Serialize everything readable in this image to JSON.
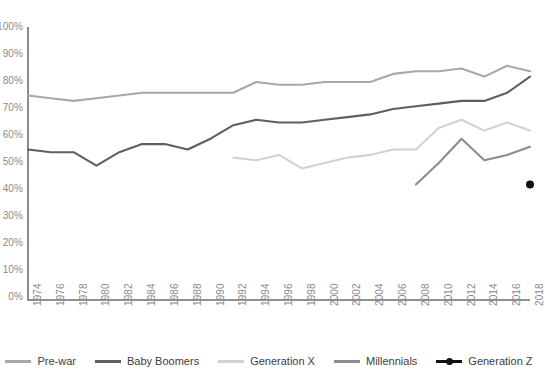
{
  "chart_data": {
    "type": "line",
    "title": "",
    "xlabel": "",
    "ylabel": "",
    "grid": false,
    "legend_position": "bottom",
    "xlim": [
      1974,
      2018
    ],
    "ylim": [
      0,
      100
    ],
    "y_ticks": [
      0,
      10,
      20,
      30,
      40,
      50,
      60,
      70,
      80,
      90,
      100
    ],
    "y_tick_labels": [
      "0%",
      "10%",
      "20%",
      "30%",
      "40%",
      "50%",
      "60%",
      "70%",
      "80%",
      "90%",
      "100%"
    ],
    "x_tick_labels": [
      "1974",
      "1976",
      "1978",
      "1980",
      "1982",
      "1984",
      "1986",
      "1988",
      "1990",
      "1992",
      "1994",
      "1996",
      "1998",
      "2000",
      "2002",
      "2004",
      "2006",
      "2008",
      "2010",
      "2012",
      "2014",
      "2016",
      "2018"
    ],
    "x": [
      1974,
      1976,
      1978,
      1980,
      1982,
      1984,
      1986,
      1988,
      1990,
      1992,
      1994,
      1996,
      1998,
      2000,
      2002,
      2004,
      2006,
      2008,
      2010,
      2012,
      2014,
      2016,
      2018
    ],
    "series": [
      {
        "name": "Pre-war",
        "color": "#a8a8a8",
        "marker": false,
        "x": [
          1974,
          1976,
          1978,
          1980,
          1982,
          1984,
          1986,
          1988,
          1990,
          1992,
          1994,
          1996,
          1998,
          2000,
          2002,
          2004,
          2006,
          2008,
          2010,
          2012,
          2014,
          2016,
          2018
        ],
        "values": [
          75,
          74,
          73,
          74,
          75,
          76,
          76,
          76,
          76,
          76,
          80,
          79,
          79,
          80,
          80,
          80,
          83,
          84,
          84,
          85,
          82,
          86,
          84
        ]
      },
      {
        "name": "Baby Boomers",
        "color": "#5f5f5f",
        "marker": false,
        "x": [
          1974,
          1976,
          1978,
          1980,
          1982,
          1984,
          1986,
          1988,
          1990,
          1992,
          1994,
          1996,
          1998,
          2000,
          2002,
          2004,
          2006,
          2008,
          2010,
          2012,
          2014,
          2016,
          2018
        ],
        "values": [
          55,
          54,
          54,
          49,
          54,
          57,
          57,
          55,
          59,
          64,
          66,
          65,
          65,
          66,
          67,
          68,
          70,
          71,
          72,
          73,
          73,
          76,
          82
        ]
      },
      {
        "name": "Generation X",
        "color": "#d2d2d2",
        "marker": false,
        "x": [
          1992,
          1994,
          1996,
          1998,
          2000,
          2002,
          2004,
          2006,
          2008,
          2010,
          2012,
          2014,
          2016,
          2018
        ],
        "values": [
          52,
          51,
          53,
          48,
          50,
          52,
          53,
          55,
          55,
          63,
          66,
          62,
          65,
          62
        ]
      },
      {
        "name": "Millennials",
        "color": "#8c8c8c",
        "marker": false,
        "x": [
          2008,
          2010,
          2012,
          2014,
          2016,
          2018
        ],
        "values": [
          42,
          50,
          59,
          51,
          53,
          56
        ]
      },
      {
        "name": "Generation Z",
        "color": "#111111",
        "marker": true,
        "x": [
          2018
        ],
        "values": [
          42
        ]
      }
    ]
  },
  "legend": {
    "items": [
      {
        "label": "Pre-war",
        "color": "#a8a8a8",
        "marker": false
      },
      {
        "label": "Baby Boomers",
        "color": "#5f5f5f",
        "marker": false
      },
      {
        "label": "Generation X",
        "color": "#d2d2d2",
        "marker": false
      },
      {
        "label": "Millennials",
        "color": "#8c8c8c",
        "marker": false
      },
      {
        "label": "Generation Z",
        "color": "#111111",
        "marker": true
      }
    ]
  },
  "axes": {
    "spine_color": "#6e6e6e",
    "tick_text_color": "#8a8a8a"
  }
}
